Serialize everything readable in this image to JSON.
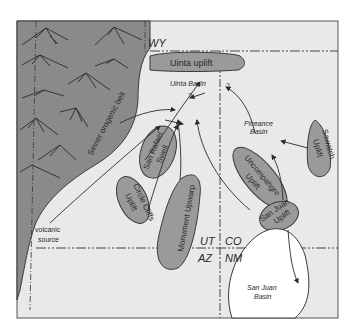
{
  "figure": {
    "colors": {
      "background": "#ffffff",
      "map_fill": "#e9e9e9",
      "orogenic_belt": "#8a8a8a",
      "uplift": "#9a9a9a",
      "basin_fill": "#ffffff",
      "line": "#3a3a3a"
    }
  },
  "labels": {
    "wy": "WY",
    "uinta_uplift": "Uinta uplift",
    "uinta_basin": "Uinta Basin",
    "q1": "?",
    "q2": "?",
    "q3": "?",
    "piceance_1": "Piceance",
    "piceance_2": "Basin",
    "sawatch_1": "Sawatch",
    "sawatch_2": "Uplift",
    "sevier": "Sevier orogenic belt",
    "san_rafael_1": "San Rafael",
    "san_rafael_2": "Swell",
    "uncompahgre_1": "Uncompahgre",
    "uncompahgre_2": "Uplift",
    "circle_cliffs_1": "Circle Cliffs",
    "circle_cliffs_2": "Uplift",
    "monument": "Monument Upwarp",
    "san_juan_uplift_1": "San Juan",
    "san_juan_uplift_2": "Uplift",
    "volcanic_1": "volcanic",
    "volcanic_2": "source",
    "ut": "UT",
    "co": "CO",
    "az": "AZ",
    "nm": "NM",
    "san_juan_basin_1": "San Juan",
    "san_juan_basin_2": "Basin"
  }
}
